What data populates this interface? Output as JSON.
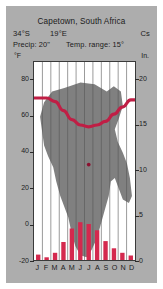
{
  "card": {
    "title": "Capetown, South Africa",
    "latitude": "34°S",
    "longitude": "19°E",
    "koppen_code": "Cs",
    "precip_label": "Precip: 20\"",
    "temp_range_label": "Temp. range: 15°",
    "left_axis_caption": "°F",
    "right_axis_caption": "In.",
    "background_color": "#adadad",
    "plot_background_color": "#ffffff",
    "continent_color": "#808080",
    "bar_color": "#d4294e",
    "line_color": "#c01e45"
  },
  "chart_data": {
    "type": "bar",
    "title": "Capetown, South Africa",
    "subtitle": "34°S 19°E  Cs",
    "categories": [
      "J",
      "F",
      "M",
      "A",
      "M",
      "J",
      "J",
      "A",
      "S",
      "O",
      "N",
      "D"
    ],
    "month_labels": [
      "J",
      "F",
      "M",
      "A",
      "M",
      "J",
      "J",
      "A",
      "S",
      "O",
      "N",
      "D"
    ],
    "xlabel": "",
    "ylabel": "°F",
    "y2label": "In.",
    "ylim": [
      -20,
      90
    ],
    "y2lim": [
      0,
      22
    ],
    "yticks": [
      80,
      60,
      40,
      20,
      0,
      -20
    ],
    "ytick_labels": [
      "80",
      "60",
      "40",
      "20",
      "0",
      "-20"
    ],
    "y2ticks": [
      20,
      15,
      10,
      5,
      0
    ],
    "y2tick_labels": [
      "20",
      "15",
      "10",
      "5",
      "0"
    ],
    "grid": true,
    "legend": "none",
    "series": [
      {
        "name": "Precipitation",
        "type": "bar",
        "unit": "in",
        "axis": "right",
        "values": [
          0.6,
          0.3,
          0.8,
          2.0,
          3.5,
          4.2,
          4.0,
          3.3,
          2.1,
          1.3,
          0.8,
          0.5
        ]
      },
      {
        "name": "Temperature",
        "type": "line",
        "unit": "degF",
        "axis": "left",
        "values": [
          70,
          70,
          68,
          63,
          58,
          55,
          54,
          55,
          57,
          61,
          65,
          69
        ]
      }
    ],
    "annotations": [
      {
        "name": "city-marker",
        "label": "Capetown",
        "month_index": 6,
        "value_f": 33
      }
    ]
  }
}
